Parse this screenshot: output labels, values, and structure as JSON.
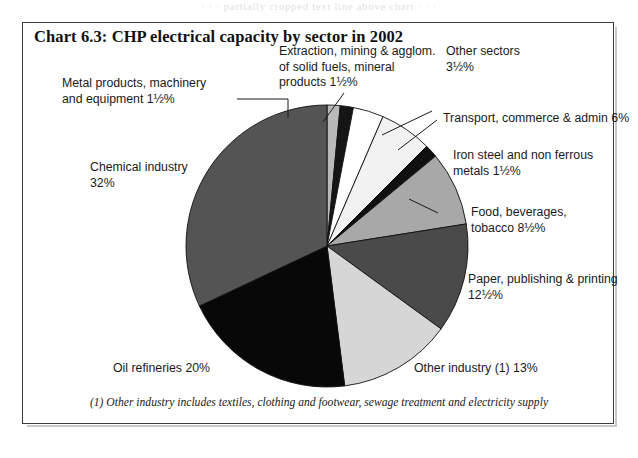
{
  "page": {
    "cut_text_top": "· · ·  partially cropped text line above chart  · · ·"
  },
  "chart_box": {
    "title": "Chart 6.3: CHP electrical capacity by sector in 2002",
    "footnote": "(1) Other industry includes textiles, clothing and footwear, sewage treatment and electricity supply"
  },
  "labels": {
    "metal": "Metal products, machinery\nand equipment 1½%",
    "extraction": "Extraction, mining & agglom.\nof solid fuels, mineral\nproducts 1½%",
    "other_sectors": "Other sectors\n    3½%",
    "transport": "Transport, commerce & admin 6%",
    "iron": "Iron steel and non ferrous\nmetals 1½%",
    "food": "Food, beverages,\ntobacco 8½%",
    "paper": "Paper, publishing & printing\n12½%",
    "other_industry": "Other industry (1) 13%",
    "oil": "Oil refineries 20%",
    "chemical": "Chemical industry\n32%"
  },
  "chart_data": {
    "type": "pie",
    "title": "Chart 6.3: CHP electrical capacity by sector in 2002",
    "unit": "percent of CHP electrical capacity",
    "legend_position": "callout-labels",
    "grid": false,
    "note": "(1) Other industry includes textiles, clothing and footwear, sewage treatment and electricity supply",
    "start_angle_deg": 0,
    "direction": "clockwise",
    "categories": [
      "Metal products, machinery and equipment",
      "Extraction, mining & agglom. of solid fuels, mineral products",
      "Other sectors",
      "Transport, commerce & admin",
      "Iron steel and non ferrous metals",
      "Food, beverages, tobacco",
      "Paper, publishing & printing",
      "Other industry (1)",
      "Oil refineries",
      "Chemical industry"
    ],
    "values": [
      1.5,
      1.5,
      3.5,
      6,
      1.5,
      8.5,
      12.5,
      13,
      20,
      32
    ],
    "value_labels": [
      "1½%",
      "1½%",
      "3½%",
      "6%",
      "1½%",
      "8½%",
      "12½%",
      "13%",
      "20%",
      "32%"
    ],
    "colors": [
      "#b9b9b9",
      "#151515",
      "#ffffff",
      "#f2f2f2",
      "#101010",
      "#a8a8a8",
      "#4a4a4a",
      "#d6d6d6",
      "#080808",
      "#545454"
    ]
  }
}
